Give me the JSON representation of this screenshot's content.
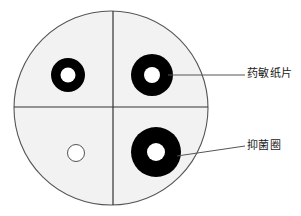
{
  "figure": {
    "type": "diagram",
    "colors": {
      "plate_fill": "#f2f2f2",
      "plate_stroke": "#555555",
      "divider_stroke": "#333333",
      "zone_fill": "#000000",
      "disc_fill": "#ffffff",
      "leader_stroke": "#555555",
      "text": "#1a1a1a",
      "background": "#ffffff"
    },
    "plate": {
      "cx": 111,
      "cy": 108,
      "r": 97
    },
    "dividers": {
      "vertical_x": 113,
      "horizontal_y": 107
    },
    "quadrants": [
      {
        "name": "upper-left",
        "zone_cx": 68,
        "zone_cy": 75,
        "zone_r": 17,
        "disc_cx": 68,
        "disc_cy": 75,
        "disc_r": 7.5,
        "has_zone": true
      },
      {
        "name": "upper-right",
        "zone_cx": 152,
        "zone_cy": 75,
        "zone_r": 21,
        "disc_cx": 152,
        "disc_cy": 75,
        "disc_r": 8,
        "has_zone": true
      },
      {
        "name": "lower-right",
        "zone_cx": 156,
        "zone_cy": 152,
        "zone_r": 25,
        "disc_cx": 156,
        "disc_cy": 152,
        "disc_r": 9,
        "has_zone": true
      },
      {
        "name": "lower-left",
        "zone_cx": 76,
        "zone_cy": 153,
        "zone_r": 8.5,
        "disc_cx": 76,
        "disc_cy": 153,
        "disc_r": 8.5,
        "has_zone": false
      }
    ],
    "leaders": [
      {
        "name": "leader-disc",
        "x1": 168,
        "y1": 75,
        "x2": 245,
        "y2": 75
      },
      {
        "name": "leader-zone",
        "x1": 177,
        "y1": 156,
        "x2": 245,
        "y2": 146
      }
    ],
    "labels": {
      "disc": "药敏纸片",
      "zone": "抑菌圈"
    }
  }
}
